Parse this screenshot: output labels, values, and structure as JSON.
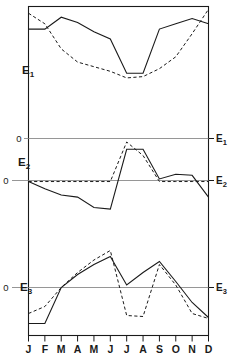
{
  "figure": {
    "kind": "multi-panel-line-chart",
    "panel_count": 3,
    "frame_color": "#1a1a1a",
    "series_colors": {
      "solid": "#1a1a1a",
      "dashed": "#1a1a1a"
    },
    "zero_line_color": "#6e6e6e"
  },
  "axis": {
    "x_tick_labels": [
      "J",
      "F",
      "M",
      "A",
      "M",
      "J",
      "J",
      "A",
      "S",
      "O",
      "N",
      "D"
    ],
    "zero_label": "0"
  },
  "panel_labels": {
    "e1_left": "E",
    "e1_left_sub": "1",
    "e2_left": "E",
    "e2_left_sub": "2",
    "e3_left": "E",
    "e3_left_sub": "3",
    "e1_right": "E",
    "e1_right_sub": "1",
    "e2_right": "E",
    "e2_right_sub": "2",
    "e3_right": "E",
    "e3_right_sub": "3"
  },
  "zero_labels": {
    "e1_zero": "0",
    "e2_zero": "0",
    "e3_zero": "0"
  },
  "chart_data": {
    "type": "line",
    "title": "",
    "xlabel": "",
    "ylabel": "",
    "grid": false,
    "legend": "none",
    "x": [
      "J",
      "F",
      "M",
      "A",
      "M",
      "J",
      "J",
      "A",
      "S",
      "O",
      "N",
      "D"
    ],
    "panels": [
      {
        "name": "E1",
        "label": "E₁",
        "ylim": [
          -1.0,
          1.0
        ],
        "zero_line": false,
        "series": [
          {
            "name": "E1-solid",
            "style": "solid",
            "values": [
              0.62,
              0.62,
              0.8,
              0.72,
              0.58,
              0.47,
              -0.05,
              -0.05,
              0.62,
              0.7,
              0.78,
              0.7
            ]
          },
          {
            "name": "E1-dashed",
            "style": "dashed",
            "values": [
              0.86,
              0.7,
              0.32,
              0.12,
              0.05,
              -0.02,
              -0.12,
              -0.1,
              0.02,
              0.2,
              0.55,
              0.92
            ]
          }
        ]
      },
      {
        "name": "E2",
        "label": "E₂",
        "ylim": [
          -1.0,
          1.0
        ],
        "zero_line": true,
        "reference_lines": [
          {
            "label": "E1",
            "value": 0.38
          },
          {
            "label": "E2",
            "value": -0.02
          }
        ],
        "series": [
          {
            "name": "E2-solid",
            "style": "solid",
            "values": [
              -0.02,
              -0.16,
              -0.28,
              -0.32,
              -0.52,
              -0.55,
              0.6,
              0.6,
              0.03,
              0.12,
              0.1,
              -0.32
            ]
          },
          {
            "name": "E2-dashed",
            "style": "dashed",
            "values": [
              -0.02,
              -0.02,
              -0.02,
              -0.02,
              -0.02,
              -0.02,
              0.74,
              0.48,
              -0.02,
              -0.02,
              -0.02,
              -0.02
            ]
          }
        ]
      },
      {
        "name": "E3",
        "label": "E₃",
        "ylim": [
          -1.0,
          1.0
        ],
        "zero_line": true,
        "series": [
          {
            "name": "E3-solid",
            "style": "solid",
            "values": [
              -0.72,
              -0.72,
              0.0,
              0.26,
              0.46,
              0.62,
              0.05,
              0.3,
              0.52,
              0.12,
              -0.3,
              -0.6
            ]
          },
          {
            "name": "E3-dashed",
            "style": "dashed",
            "values": [
              -0.52,
              -0.38,
              0.0,
              0.3,
              0.55,
              0.74,
              -0.56,
              -0.58,
              0.46,
              0.05,
              -0.52,
              -0.62
            ]
          }
        ]
      }
    ]
  }
}
